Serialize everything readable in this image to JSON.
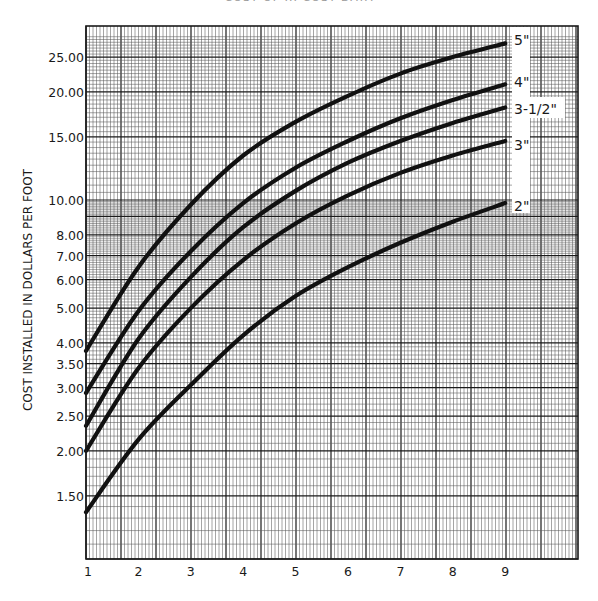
{
  "chart_data": {
    "type": "line",
    "title": "COST OF ... COST DATA",
    "title_note": "title clipped at top edge of image",
    "xlabel": "",
    "ylabel": "COST INSTALLED IN DOLLARS PER FOOT",
    "y_scale": "log",
    "ylim": [
      1.0,
      28.5
    ],
    "xlim": [
      1,
      10.4
    ],
    "grid": true,
    "x_ticks": [
      1,
      2,
      3,
      4,
      5,
      6,
      7,
      8,
      9
    ],
    "x_tick_labels": [
      "1",
      "2",
      "3",
      "4",
      "5",
      "6",
      "7",
      "8",
      "9"
    ],
    "y_ticks": [
      1.5,
      2.0,
      2.5,
      3.0,
      3.5,
      4.0,
      5.0,
      6.0,
      7.0,
      8.0,
      10.0,
      15.0,
      20.0,
      25.0
    ],
    "y_tick_labels": [
      "1.50",
      "2.00",
      "2.50",
      "3.00",
      "3.50",
      "4.00",
      "5.00",
      "6.00",
      "7.00",
      "8.00",
      "10.00",
      "15.00",
      "20.00",
      "25.00"
    ],
    "legend_position": "right, inline labels at curve ends",
    "x": [
      1,
      2,
      3,
      4,
      5,
      6,
      7,
      8,
      9
    ],
    "series": [
      {
        "name": "5\"",
        "label": "5\"",
        "values": [
          3.8,
          6.5,
          9.7,
          13.3,
          16.5,
          19.5,
          22.5,
          25.0,
          27.3
        ]
      },
      {
        "name": "4\"",
        "label": "4\"",
        "values": [
          2.9,
          4.9,
          7.2,
          9.8,
          12.3,
          14.6,
          16.9,
          19.0,
          21.0
        ]
      },
      {
        "name": "3-1/2\"",
        "label": "3-1/2\"",
        "values": [
          2.35,
          4.1,
          6.1,
          8.4,
          10.6,
          12.7,
          14.6,
          16.4,
          18.1
        ]
      },
      {
        "name": "3\"",
        "label": "3\"",
        "values": [
          2.0,
          3.4,
          5.0,
          6.8,
          8.6,
          10.3,
          11.9,
          13.3,
          14.6
        ]
      },
      {
        "name": "2\"",
        "label": "2\"",
        "values": [
          1.35,
          2.15,
          3.05,
          4.2,
          5.4,
          6.5,
          7.6,
          8.7,
          9.8
        ]
      }
    ]
  },
  "colors": {
    "background": "#ffffff",
    "grid_minor": "#5a5a5a",
    "grid_major": "#1a1a1a",
    "curve": "#111111",
    "text": "#1a1a1a"
  }
}
